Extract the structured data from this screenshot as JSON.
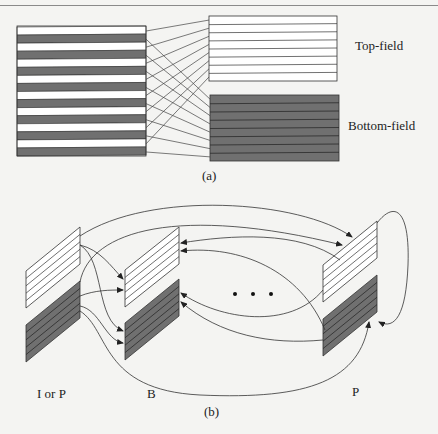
{
  "figure": {
    "colors": {
      "background": "#f4f4f2",
      "field_gray": "#707070",
      "line": "#333333",
      "white": "#ffffff"
    },
    "panel_a": {
      "caption": "(a)",
      "frame_stripes": 16,
      "field_stripes": 8,
      "labels": {
        "top_field": "Top-field",
        "bottom_field": "Bottom-field"
      }
    },
    "panel_b": {
      "caption": "(b)",
      "frames": [
        {
          "label": "I or P"
        },
        {
          "label": "B"
        },
        {
          "label": "P"
        }
      ],
      "ellipsis": "• • •"
    }
  }
}
